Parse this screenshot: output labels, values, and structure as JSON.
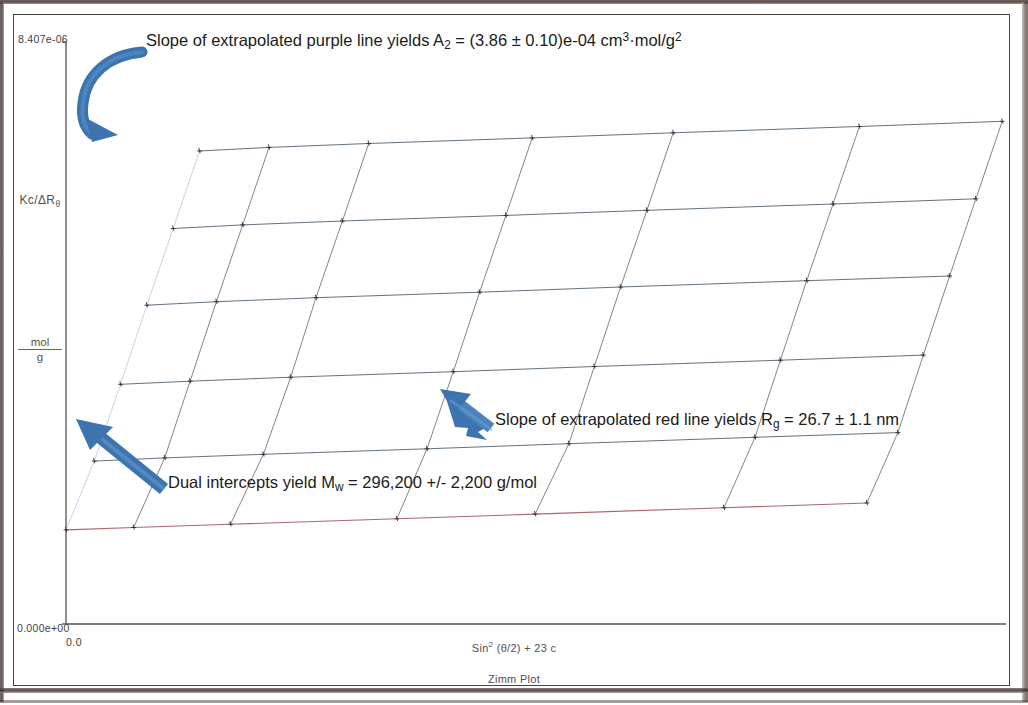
{
  "chart_data": {
    "type": "line",
    "title": "Zimm Plot",
    "subtitle": "Zimm Plot",
    "xlabel": "Sin² (θ/2) + 23 c",
    "ylabel": "Kc/ΔRθ",
    "ylabel_units_numerator": "mol",
    "ylabel_units_denominator": "g",
    "xlim_labels": [
      "0.0",
      ""
    ],
    "ylim_labels": [
      "0.000e+00",
      "8.407e-06"
    ],
    "ylim": [
      0.0,
      8.407e-06
    ],
    "grid": false,
    "legend_position": "none",
    "angle_series_count": 7,
    "concentration_series_count": 6,
    "extrapolated_lines": [
      {
        "name": "c → 0 extrapolation",
        "color": "#9e4a52",
        "label": "red line",
        "yields": "Rg = 26.7 ± 1.1 nm"
      },
      {
        "name": "θ → 0 extrapolation",
        "color": "#b9a9d6",
        "label": "purple line",
        "yields": "A2 = (3.86 ± 0.10)e-04 cm³·mol/g²"
      }
    ],
    "common_intercept": {
      "x_label": "0.0",
      "y_label": "1/Mw",
      "yields": "Mw = 296,200 +/- 2,200 g/mol"
    },
    "series": [
      {
        "name": "c1 (lowest, red c=0 extrapolation)",
        "color": "#9e4a52",
        "points": [
          [
            0.0,
            1.19
          ],
          [
            0.072,
            1.22
          ],
          [
            0.175,
            1.262
          ],
          [
            0.352,
            1.33
          ],
          [
            0.499,
            1.39
          ],
          [
            0.7,
            1.47
          ],
          [
            0.852,
            1.53
          ]
        ]
      },
      {
        "name": "c2",
        "color": "#4a5a6b",
        "points": [
          [
            0.03,
            2.06
          ],
          [
            0.105,
            2.1
          ],
          [
            0.21,
            2.145
          ],
          [
            0.384,
            2.215
          ],
          [
            0.535,
            2.28
          ],
          [
            0.733,
            2.36
          ],
          [
            0.885,
            2.42
          ]
        ]
      },
      {
        "name": "c3",
        "color": "#4a5a6b",
        "points": [
          [
            0.058,
            3.03
          ],
          [
            0.132,
            3.07
          ],
          [
            0.239,
            3.12
          ],
          [
            0.412,
            3.19
          ],
          [
            0.562,
            3.255
          ],
          [
            0.76,
            3.335
          ],
          [
            0.912,
            3.4
          ]
        ]
      },
      {
        "name": "c4",
        "color": "#4a5a6b",
        "points": [
          [
            0.086,
            4.03
          ],
          [
            0.16,
            4.075
          ],
          [
            0.266,
            4.125
          ],
          [
            0.44,
            4.195
          ],
          [
            0.59,
            4.26
          ],
          [
            0.788,
            4.34
          ],
          [
            0.94,
            4.4
          ]
        ]
      },
      {
        "name": "c5",
        "color": "#4a5a6b",
        "points": [
          [
            0.114,
            5.0
          ],
          [
            0.188,
            5.045
          ],
          [
            0.294,
            5.095
          ],
          [
            0.468,
            5.165
          ],
          [
            0.618,
            5.23
          ],
          [
            0.816,
            5.31
          ],
          [
            0.968,
            5.375
          ]
        ]
      },
      {
        "name": "c6 (highest)",
        "color": "#4a5a6b",
        "points": [
          [
            0.142,
            5.98
          ],
          [
            0.216,
            6.025
          ],
          [
            0.322,
            6.075
          ],
          [
            0.496,
            6.145
          ],
          [
            0.646,
            6.21
          ],
          [
            0.844,
            6.29
          ],
          [
            0.996,
            6.355
          ]
        ]
      }
    ],
    "angle_lines": [
      {
        "name": "theta = 0 (purple extrapolation)",
        "color": "#b9a9d6",
        "points": [
          [
            0.0,
            1.19
          ],
          [
            0.03,
            2.06
          ],
          [
            0.058,
            3.03
          ],
          [
            0.086,
            4.03
          ],
          [
            0.114,
            5.0
          ],
          [
            0.142,
            5.98
          ]
        ]
      },
      {
        "name": "theta 2",
        "color": "#55606b",
        "points": [
          [
            0.072,
            1.22
          ],
          [
            0.105,
            2.1
          ],
          [
            0.132,
            3.07
          ],
          [
            0.16,
            4.075
          ],
          [
            0.188,
            5.045
          ],
          [
            0.216,
            6.025
          ]
        ]
      },
      {
        "name": "theta 3",
        "color": "#55606b",
        "points": [
          [
            0.175,
            1.262
          ],
          [
            0.21,
            2.145
          ],
          [
            0.239,
            3.12
          ],
          [
            0.266,
            4.125
          ],
          [
            0.294,
            5.095
          ],
          [
            0.322,
            6.075
          ]
        ]
      },
      {
        "name": "theta 4",
        "color": "#55606b",
        "points": [
          [
            0.352,
            1.33
          ],
          [
            0.384,
            2.215
          ],
          [
            0.412,
            3.19
          ],
          [
            0.44,
            4.195
          ],
          [
            0.468,
            5.165
          ],
          [
            0.496,
            6.145
          ]
        ]
      },
      {
        "name": "theta 5",
        "color": "#55606b",
        "points": [
          [
            0.499,
            1.39
          ],
          [
            0.535,
            2.28
          ],
          [
            0.562,
            3.255
          ],
          [
            0.59,
            4.26
          ],
          [
            0.618,
            5.23
          ],
          [
            0.646,
            6.21
          ]
        ]
      },
      {
        "name": "theta 6",
        "color": "#55606b",
        "points": [
          [
            0.7,
            1.47
          ],
          [
            0.733,
            2.36
          ],
          [
            0.76,
            3.335
          ],
          [
            0.788,
            4.34
          ],
          [
            0.816,
            5.31
          ],
          [
            0.844,
            6.29
          ]
        ]
      },
      {
        "name": "theta 7",
        "color": "#55606b",
        "points": [
          [
            0.852,
            1.53
          ],
          [
            0.885,
            2.42
          ],
          [
            0.912,
            3.4
          ],
          [
            0.94,
            4.4
          ],
          [
            0.968,
            5.375
          ],
          [
            0.996,
            6.355
          ]
        ]
      }
    ]
  },
  "axis": {
    "y_tick_top": "8.407e-06",
    "y_tick_bottom": "0.000e+00",
    "x_tick_zero": "0.0",
    "y_title_main": "Kc/ΔR",
    "y_title_sub": "θ",
    "y_units_numerator": "mol",
    "y_units_denominator": "g",
    "x_title_prefix": "Sin",
    "x_title_sup": "2",
    "x_title_rest": " (θ/2) + 23 c",
    "subtitle": "Zimm Plot"
  },
  "annotations": {
    "purple": {
      "part1": "Slope of extrapolated purple line yields A",
      "sub1": "2",
      "part2": " = (3.86 ± 0.10)e-04 cm",
      "sup1": "3",
      "part3": "·mol/g",
      "sup2": "2"
    },
    "red": {
      "part1": "Slope of extrapolated red line yields R",
      "sub1": "g",
      "part2": " = 26.7 ± 1.1 nm"
    },
    "mw": {
      "part1": "Dual intercepts yield M",
      "sub1": "w",
      "part2": " = 296,200 +/- 2,200 g/mol"
    }
  },
  "colors": {
    "arrow_blue": "#3d74b0",
    "arrow_blue_light": "#5b93cb",
    "red_line": "#9e4a52",
    "purple_line": "#b9a9d6",
    "grid_line": "#55606b",
    "axis": "#56514d",
    "frame": "#4a4440"
  }
}
